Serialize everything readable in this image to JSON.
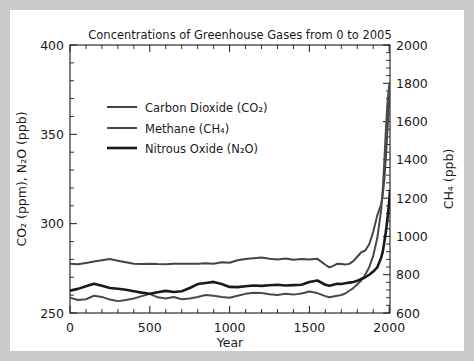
{
  "figure": {
    "title": "Concentrations of Greenhouse Gases from 0 to 2005",
    "background_color": "#ffffff",
    "page_border_color": "#c9c9c9",
    "axis_color": "#1a1a1a"
  },
  "axes": {
    "x": {
      "label": "Year",
      "ticks": [
        "0",
        "500",
        "1000",
        "1500",
        "2000"
      ],
      "tick_values": [
        0,
        500,
        1000,
        1500,
        2000
      ],
      "range": [
        0,
        2005
      ],
      "minor_per_major": 5
    },
    "y_left": {
      "label": "CO₂ (ppm), N₂O (ppb)",
      "ticks": [
        "250",
        "300",
        "350",
        "400"
      ],
      "tick_values": [
        250,
        300,
        350,
        400
      ],
      "range": [
        250,
        400
      ],
      "minor_per_major": 5
    },
    "y_right": {
      "label": "CH₄ (ppb)",
      "ticks": [
        "600",
        "800",
        "1000",
        "1200",
        "1400",
        "1600",
        "1800",
        "2000"
      ],
      "tick_values": [
        600,
        800,
        1000,
        1200,
        1400,
        1600,
        1800,
        2000
      ],
      "range": [
        600,
        2000
      ],
      "minor_per_major": 5
    }
  },
  "legend": {
    "position": "upper-left-inside",
    "entries": [
      {
        "label": "Carbon Dioxide  (CO₂)",
        "color": "#444444",
        "width": 2.0
      },
      {
        "label": "Methane  (CH₄)",
        "color": "#4a4a4a",
        "width": 2.0
      },
      {
        "label": "Nitrous Oxide  (N₂O)",
        "color": "#1a1a1a",
        "width": 2.6
      }
    ]
  },
  "chart_data": {
    "type": "line",
    "title": "Concentrations of Greenhouse Gases from 0 to 2005",
    "xlabel": "Year",
    "ylabel": "CO₂ (ppm), N₂O (ppb)",
    "ylabel_right": "CH₄ (ppb)",
    "xlim": [
      0,
      2005
    ],
    "ylim": [
      250,
      400
    ],
    "ylim_right": [
      600,
      2000
    ],
    "grid": false,
    "legend_position": "upper left",
    "series": [
      {
        "name": "Carbon Dioxide  (CO₂)",
        "axis": "left",
        "unit": "ppm",
        "color": "#444444",
        "x": [
          0,
          50,
          100,
          150,
          200,
          250,
          300,
          350,
          400,
          450,
          500,
          550,
          600,
          650,
          700,
          750,
          800,
          850,
          900,
          950,
          1000,
          1050,
          1100,
          1150,
          1200,
          1250,
          1300,
          1350,
          1400,
          1450,
          1500,
          1550,
          1600,
          1625,
          1650,
          1675,
          1700,
          1725,
          1750,
          1775,
          1800,
          1825,
          1850,
          1875,
          1900,
          1925,
          1950,
          1960,
          1970,
          1980,
          1990,
          2000,
          2005
        ],
        "y": [
          277.5,
          277.3,
          278.0,
          278.8,
          279.5,
          280.2,
          279.3,
          278.4,
          277.6,
          277.4,
          277.6,
          277.4,
          277.3,
          277.5,
          277.6,
          277.5,
          277.6,
          277.8,
          277.6,
          278.4,
          278.1,
          279.5,
          280.2,
          280.6,
          281.0,
          280.4,
          280.0,
          280.5,
          279.8,
          280.2,
          280.0,
          280.3,
          277.0,
          275.5,
          276.4,
          277.6,
          277.4,
          277.2,
          277.5,
          279.0,
          281.5,
          284.0,
          285.0,
          288.5,
          295.5,
          304.5,
          311.0,
          316.5,
          325.0,
          338.5,
          354.0,
          369.5,
          379.0
        ]
      },
      {
        "name": "Methane  (CH₄)",
        "axis": "right",
        "unit": "ppb",
        "color": "#4a4a4a",
        "x": [
          0,
          50,
          100,
          150,
          200,
          250,
          300,
          350,
          400,
          450,
          500,
          550,
          600,
          650,
          700,
          750,
          800,
          850,
          900,
          950,
          1000,
          1050,
          1100,
          1150,
          1200,
          1250,
          1300,
          1350,
          1400,
          1450,
          1500,
          1550,
          1600,
          1625,
          1650,
          1675,
          1700,
          1725,
          1750,
          1775,
          1800,
          1825,
          1850,
          1875,
          1900,
          1925,
          1950,
          1960,
          1970,
          1980,
          1990,
          2000,
          2005
        ],
        "y": [
          680,
          668,
          672,
          690,
          684,
          670,
          662,
          668,
          676,
          688,
          700,
          682,
          676,
          684,
          672,
          676,
          684,
          694,
          690,
          684,
          680,
          690,
          700,
          706,
          704,
          698,
          694,
          700,
          696,
          702,
          712,
          704,
          688,
          682,
          686,
          690,
          694,
          702,
          716,
          730,
          750,
          770,
          800,
          840,
          900,
          990,
          1140,
          1250,
          1400,
          1570,
          1710,
          1790,
          1800
        ]
      },
      {
        "name": "Nitrous Oxide  (N₂O)",
        "axis": "left",
        "unit": "ppb",
        "color": "#1a1a1a",
        "x": [
          0,
          50,
          100,
          150,
          200,
          250,
          300,
          350,
          400,
          450,
          500,
          550,
          600,
          650,
          700,
          750,
          800,
          850,
          900,
          950,
          1000,
          1050,
          1100,
          1150,
          1200,
          1250,
          1300,
          1350,
          1400,
          1450,
          1500,
          1550,
          1600,
          1625,
          1650,
          1675,
          1700,
          1725,
          1750,
          1775,
          1800,
          1825,
          1850,
          1875,
          1900,
          1925,
          1950,
          1960,
          1970,
          1980,
          1990,
          2000,
          2005
        ],
        "y": [
          262.5,
          263.5,
          265.0,
          266.4,
          265.2,
          264.0,
          263.6,
          263.0,
          262.2,
          261.4,
          260.8,
          261.6,
          262.4,
          261.8,
          262.2,
          264.0,
          266.2,
          266.8,
          267.4,
          266.2,
          264.6,
          264.5,
          265.0,
          265.4,
          265.2,
          265.5,
          265.8,
          265.4,
          265.6,
          265.8,
          267.4,
          268.2,
          265.8,
          265.2,
          265.8,
          266.4,
          266.2,
          266.6,
          267.0,
          267.4,
          268.0,
          269.0,
          270.0,
          271.4,
          273.2,
          275.5,
          281.0,
          284.5,
          290.0,
          296.0,
          303.5,
          312.5,
          318.5
        ]
      }
    ]
  }
}
